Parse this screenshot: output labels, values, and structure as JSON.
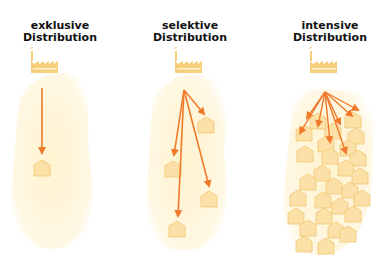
{
  "panels": [
    {
      "title_line1": "exklusive",
      "title_line2": "Distribution",
      "outlets": 1
    },
    {
      "title_line1": "selektive",
      "title_line2": "Distribution",
      "outlets": 4
    },
    {
      "title_line1": "intensive",
      "title_line2": "Distribution",
      "outlets": 28
    }
  ],
  "colors": {
    "arrow": "#f07a2a",
    "house_fill": "#fbe1a8",
    "house_stroke": "#f2c572",
    "factory": "#f7cf7a",
    "blob": "#fff6dc"
  }
}
